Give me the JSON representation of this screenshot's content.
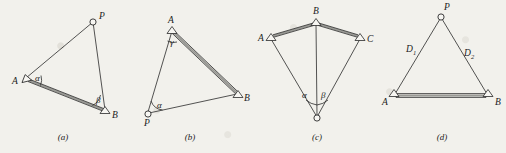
{
  "figure": {
    "background_color": "#f2f1ec",
    "ink_color": "#2a2a2a",
    "baseline_fill_color": "#9a9a95"
  },
  "panels": [
    {
      "id": "a",
      "caption": "(a)",
      "caption_x": 63,
      "caption_y": 139,
      "markers": [
        {
          "name": "A",
          "kind": "triangle",
          "x": 26,
          "y": 78,
          "label": "A",
          "label_x": 12,
          "label_y": 84,
          "rot": -12
        },
        {
          "name": "B",
          "kind": "triangle",
          "x": 105,
          "y": 110,
          "label": "B",
          "label_x": 112,
          "label_y": 118,
          "rot": 0
        },
        {
          "name": "P",
          "kind": "circle",
          "x": 93,
          "y": 22,
          "label": "P",
          "label_x": 99,
          "label_y": 19
        }
      ],
      "sight_lines": [
        {
          "from": "A",
          "to": "P",
          "x1": 26,
          "y1": 78,
          "x2": 93,
          "y2": 22
        },
        {
          "from": "P",
          "to": "B",
          "x1": 93,
          "y1": 22,
          "x2": 105,
          "y2": 110
        }
      ],
      "baselines": [
        {
          "from": "A",
          "to": "B",
          "x1": 28,
          "y1": 80,
          "x2": 104,
          "y2": 110
        }
      ],
      "angles": [
        {
          "symbol": "α",
          "at": "A",
          "label_x": 35,
          "label_y": 80,
          "arc": "M 41 76 A 16 16 0 0 1 40.5 85"
        },
        {
          "symbol": "β",
          "at": "B",
          "label_x": 97,
          "label_y": 103,
          "arc": "M 100 95.5 A 15 15 0 0 1 92 105.5"
        }
      ]
    },
    {
      "id": "b",
      "caption": "(b)",
      "caption_x": 190,
      "caption_y": 139,
      "markers": [
        {
          "name": "A",
          "kind": "triangle",
          "x": 172,
          "y": 30,
          "label": "A",
          "label_x": 167,
          "label_y": 24,
          "rot": 0
        },
        {
          "name": "B",
          "kind": "triangle",
          "x": 238,
          "y": 94,
          "label": "B",
          "label_x": 243,
          "label_y": 100,
          "rot": 0
        },
        {
          "name": "P",
          "kind": "circle",
          "x": 148,
          "y": 113,
          "label": "P",
          "label_x": 144,
          "label_y": 124
        }
      ],
      "sight_lines": [
        {
          "from": "P",
          "to": "A",
          "x1": 148,
          "y1": 113,
          "x2": 172,
          "y2": 31
        },
        {
          "from": "P",
          "to": "B",
          "x1": 149,
          "y1": 113,
          "x2": 237,
          "y2": 94
        }
      ],
      "baselines": [
        {
          "from": "A",
          "to": "B",
          "x1": 173,
          "y1": 32,
          "x2": 237,
          "y2": 93
        }
      ],
      "angles": [
        {
          "symbol": "γ",
          "at": "A",
          "label_x": 171,
          "label_y": 44,
          "arc": "M 167 40 A 11 11 0 0 0 177.5 41"
        },
        {
          "symbol": "α",
          "at": "P",
          "label_x": 157,
          "label_y": 107,
          "arc": "M 151.5 101 A 14 14 0 0 0 162 110.5"
        }
      ]
    },
    {
      "id": "c",
      "caption": "(c)",
      "caption_x": 317,
      "caption_y": 139,
      "markers": [
        {
          "name": "A",
          "kind": "triangle",
          "x": 271,
          "y": 37,
          "label": "A",
          "label_x": 261,
          "label_y": 40,
          "rot": 0
        },
        {
          "name": "B",
          "kind": "triangle",
          "x": 316,
          "y": 22,
          "label": "B",
          "label_x": 313,
          "label_y": 15,
          "rot": 0
        },
        {
          "name": "C",
          "kind": "triangle",
          "x": 360,
          "y": 37,
          "label": "C",
          "label_x": 366,
          "label_y": 41,
          "rot": 0
        },
        {
          "name": "P",
          "kind": "circle",
          "x": 317,
          "y": 118,
          "label": "",
          "label_x": 0,
          "label_y": 0
        }
      ],
      "sight_lines": [
        {
          "from": "P",
          "to": "A",
          "x1": 317,
          "y1": 118,
          "x2": 271,
          "y2": 38
        },
        {
          "from": "P",
          "to": "B",
          "x1": 317,
          "y1": 118,
          "x2": 316,
          "y2": 23
        },
        {
          "from": "P",
          "to": "C",
          "x1": 317,
          "y1": 118,
          "x2": 360,
          "y2": 38
        }
      ],
      "baselines": [
        {
          "from": "B",
          "to": "A",
          "x1": 315,
          "y1": 23,
          "x2": 272,
          "y2": 36
        },
        {
          "from": "B",
          "to": "C",
          "x1": 317,
          "y1": 23,
          "x2": 359,
          "y2": 36
        }
      ],
      "angles": [
        {
          "symbol": "α",
          "at": "P",
          "label_x": 303,
          "label_y": 98,
          "arc": "M 306.5 100 A 20 20 0 0 0 317 104"
        },
        {
          "symbol": "β",
          "at": "P",
          "label_x": 322,
          "label_y": 98,
          "arc": "M 317 104 A 20 20 0 0 0 327 100"
        }
      ]
    },
    {
      "id": "d",
      "caption": "(d)",
      "caption_x": 442,
      "caption_y": 139,
      "markers": [
        {
          "name": "A",
          "kind": "triangle",
          "x": 394,
          "y": 96,
          "label": "A",
          "label_x": 384,
          "label_y": 104,
          "rot": 0
        },
        {
          "name": "B",
          "kind": "triangle",
          "x": 488,
          "y": 96,
          "label": "B",
          "label_x": 494,
          "label_y": 104,
          "rot": 0
        },
        {
          "name": "P",
          "kind": "circle",
          "x": 441,
          "y": 17,
          "label": "P",
          "label_x": 444,
          "label_y": 11
        }
      ],
      "sight_lines": [
        {
          "from": "A",
          "to": "P",
          "x1": 395,
          "y1": 95,
          "x2": 440,
          "y2": 18
        },
        {
          "from": "P",
          "to": "B",
          "x1": 442,
          "y1": 18,
          "x2": 487,
          "y2": 95
        }
      ],
      "baselines": [
        {
          "from": "A",
          "to": "B",
          "x1": 396,
          "y1": 96,
          "x2": 486,
          "y2": 96
        }
      ],
      "distance_labels": [
        {
          "text": "D",
          "sub": "1",
          "x": 408,
          "y": 52
        },
        {
          "text": "D",
          "sub": "2",
          "x": 466,
          "y": 56
        }
      ],
      "angles": []
    }
  ]
}
